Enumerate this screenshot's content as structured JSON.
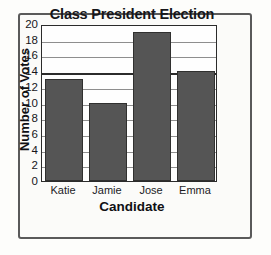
{
  "chart_data": {
    "type": "bar",
    "title": "Class President Election",
    "xlabel": "Candidate",
    "ylabel": "Number of Votes",
    "categories": [
      "Katie",
      "Jamie",
      "Jose",
      "Emma"
    ],
    "values": [
      13,
      10,
      19,
      14
    ],
    "ylim": [
      0,
      20
    ],
    "ytick_labels": [
      "0",
      "2",
      "4",
      "6",
      "8",
      "10",
      "12",
      "14",
      "16",
      "18",
      "20"
    ],
    "ytick_values": [
      0,
      2,
      4,
      6,
      8,
      10,
      12,
      14,
      16,
      18,
      20
    ],
    "ytick_step": 2,
    "grid": true,
    "grid_axis": "y",
    "legend": false,
    "bar_color": "#555555",
    "bar_edge_color": "#30302f",
    "plot_background": "#fefefe",
    "axis_color": "#2b2b2b",
    "grid_color": "#8e8e8e",
    "emphasized_gridline": 14
  }
}
